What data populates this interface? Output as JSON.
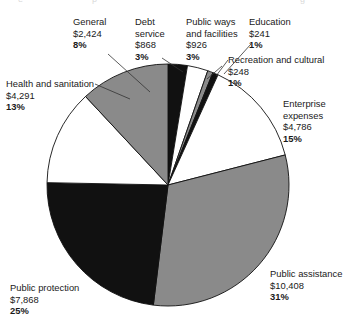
{
  "chart_data": {
    "type": "pie",
    "title": "",
    "subtitle": "",
    "xlabel": "",
    "ylabel": "",
    "legend_position": "callout-labels",
    "grid": false,
    "value_prefix": "$",
    "total": 33660,
    "categories": [
      "Debt service",
      "Public ways and facilities",
      "Education",
      "Recreation and cultural",
      "Enterprise expenses",
      "Public assistance",
      "Public protection",
      "Health and sanitation",
      "General"
    ],
    "values": [
      868,
      926,
      241,
      248,
      4786,
      10408,
      7868,
      4291,
      2424
    ],
    "percents": [
      3,
      3,
      1,
      1,
      15,
      31,
      25,
      13,
      8
    ],
    "slice_colors": [
      "#111111",
      "#ffffff",
      "#8a8a8a",
      "#111111",
      "#ffffff",
      "#8a8a8a",
      "#111111",
      "#ffffff",
      "#8a8a8a"
    ],
    "slices": [
      {
        "name": "Debt service",
        "value_label": "$868",
        "pct_label": "3%",
        "value": 868,
        "percent": 3,
        "color": "#111111",
        "start_deg": 0.0,
        "end_deg": 9.28
      },
      {
        "name": "Public ways and facilities",
        "value_label": "$926",
        "pct_label": "3%",
        "value": 926,
        "percent": 3,
        "color": "#ffffff",
        "start_deg": 9.28,
        "end_deg": 19.19
      },
      {
        "name": "Education",
        "value_label": "$241",
        "pct_label": "1%",
        "value": 241,
        "percent": 1,
        "color": "#8a8a8a",
        "start_deg": 19.19,
        "end_deg": 21.77
      },
      {
        "name": "Recreation and cultural",
        "value_label": "$248",
        "pct_label": "1%",
        "value": 248,
        "percent": 1,
        "color": "#111111",
        "start_deg": 21.77,
        "end_deg": 24.42
      },
      {
        "name": "Enterprise expenses",
        "value_label": "$4,786",
        "pct_label": "15%",
        "value": 4786,
        "percent": 15,
        "color": "#ffffff",
        "start_deg": 24.42,
        "end_deg": 75.62
      },
      {
        "name": "Public assistance",
        "value_label": "$10,408",
        "pct_label": "31%",
        "value": 10408,
        "percent": 31,
        "color": "#8a8a8a",
        "start_deg": 75.62,
        "end_deg": 186.96
      },
      {
        "name": "Public protection",
        "value_label": "$7,868",
        "pct_label": "25%",
        "value": 7868,
        "percent": 25,
        "color": "#111111",
        "start_deg": 186.96,
        "end_deg": 271.12
      },
      {
        "name": "Health and sanitation",
        "value_label": "$4,291",
        "pct_label": "13%",
        "value": 4291,
        "percent": 13,
        "color": "#ffffff",
        "start_deg": 271.12,
        "end_deg": 317.022
      },
      {
        "name": "General",
        "value_label": "$2,424",
        "pct_label": "8%",
        "value": 2424,
        "percent": 8,
        "color": "#8a8a8a",
        "start_deg": 317.022,
        "end_deg": 360.0
      }
    ]
  },
  "labels": {
    "general": {
      "name": "General",
      "value": "$2,424",
      "pct": "8%"
    },
    "debt": {
      "name": "Debt\nservice",
      "name_l1": "Debt",
      "name_l2": "service",
      "value": "$868",
      "pct": "3%"
    },
    "publicways": {
      "name": "Public ways and facilities",
      "value": "$926",
      "pct": "3%"
    },
    "education": {
      "name": "Education",
      "value": "$241",
      "pct": "1%"
    },
    "recreation": {
      "name": "Recreation and cultural",
      "value": "$248",
      "pct": "1%"
    },
    "enterprise": {
      "name": "Enterprise expenses",
      "value": "$4,786",
      "pct": "15%"
    },
    "health": {
      "name": "Health and sanitation",
      "value": "$4,291",
      "pct": "13%"
    },
    "protection": {
      "name": "Public protection",
      "value": "$7,868",
      "pct": "25%"
    },
    "assistance": {
      "name": "Public assistance",
      "value": "$10,408",
      "pct": "31%"
    }
  }
}
